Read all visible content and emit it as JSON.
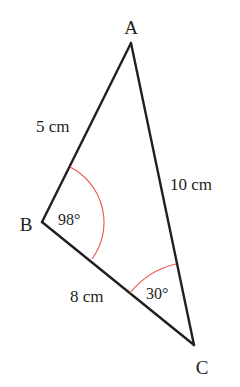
{
  "figure": {
    "type": "triangle",
    "colors": {
      "edge": "#231f20",
      "angle_arc": "#e8524a",
      "text": "#231f20",
      "background": "#ffffff"
    },
    "vertices": {
      "A": {
        "label": "A",
        "x": 131,
        "y": 43
      },
      "B": {
        "label": "B",
        "x": 42,
        "y": 222
      },
      "C": {
        "label": "C",
        "x": 194,
        "y": 345
      }
    },
    "sides": {
      "AB": {
        "label": "5 cm"
      },
      "AC": {
        "label": "10 cm"
      },
      "BC": {
        "label": "8 cm"
      }
    },
    "angles": {
      "B": {
        "label": "98°"
      },
      "C": {
        "label": "30°"
      }
    }
  }
}
